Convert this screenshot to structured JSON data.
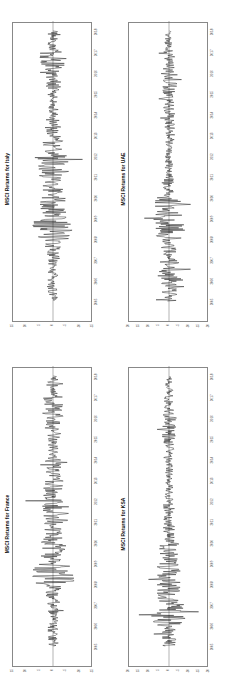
{
  "chart_data": [
    {
      "type": "line",
      "title": "MSCI Returns for KSA",
      "xlabel": "",
      "ylabel": "",
      "x_ticks": [
        "2005",
        "2006",
        "2007",
        "2008",
        "2009",
        "2010",
        "2011",
        "2012",
        "2013",
        "2014",
        "2015",
        "2016",
        "2017",
        "2018"
      ],
      "y_ticks": [
        20,
        15,
        10,
        5,
        0,
        -5,
        -10,
        -15,
        -20
      ],
      "ylim": [
        -20,
        20
      ],
      "volatility": [
        4,
        9,
        6,
        6,
        5,
        3,
        3,
        2,
        2,
        3,
        4,
        3,
        2,
        2
      ]
    },
    {
      "type": "line",
      "title": "MSCI Returns for UAE",
      "xlabel": "",
      "ylabel": "",
      "x_ticks": [
        "2005",
        "2006",
        "2007",
        "2008",
        "2009",
        "2010",
        "2011",
        "2012",
        "2013",
        "2014",
        "2015",
        "2016",
        "2017",
        "2018"
      ],
      "y_ticks": [
        20,
        15,
        10,
        5,
        0,
        -5,
        -10,
        -15,
        -20
      ],
      "ylim": [
        -20,
        20
      ],
      "volatility": [
        4,
        6,
        4,
        8,
        7,
        3,
        2,
        2,
        3,
        3,
        4,
        3,
        2,
        2
      ]
    },
    {
      "type": "line",
      "title": "MSCI Returns for France",
      "xlabel": "",
      "ylabel": "",
      "x_ticks": [
        "2005",
        "2006",
        "2007",
        "2008",
        "2009",
        "2010",
        "2011",
        "2012",
        "2013",
        "2014",
        "2015",
        "2016",
        "2017",
        "2018"
      ],
      "y_ticks": [
        15,
        10,
        5,
        0,
        -5,
        -10,
        -15
      ],
      "ylim": [
        -15,
        15
      ],
      "volatility": [
        2,
        2,
        3,
        8,
        5,
        4,
        6,
        4,
        3,
        2,
        3,
        4,
        2,
        2
      ]
    },
    {
      "type": "line",
      "title": "MSCI Returns for Italy",
      "xlabel": "",
      "ylabel": "",
      "x_ticks": [
        "2005",
        "2006",
        "2007",
        "2008",
        "2009",
        "2010",
        "2011",
        "2012",
        "2013",
        "2014",
        "2015",
        "2016",
        "2017",
        "2018"
      ],
      "y_ticks": [
        15,
        10,
        5,
        0,
        -5,
        -10,
        -15
      ],
      "ylim": [
        -15,
        15
      ],
      "volatility": [
        2,
        2,
        3,
        8,
        5,
        4,
        6,
        4,
        3,
        2,
        3,
        5,
        2,
        2
      ]
    }
  ]
}
